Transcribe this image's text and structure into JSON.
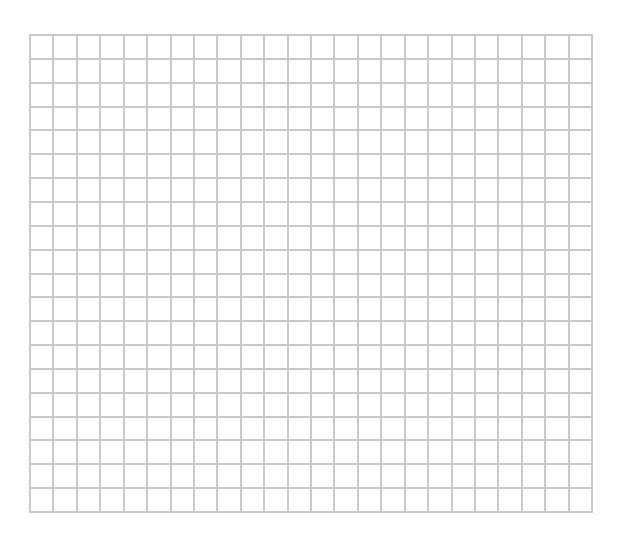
{
  "grid": {
    "left": 29,
    "top": 34,
    "width": 564,
    "height": 479,
    "columns": 24,
    "rows": 20,
    "line_color": "#c9c9c9",
    "background_color": "#ffffff"
  }
}
